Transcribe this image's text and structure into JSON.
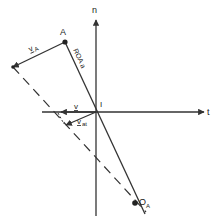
{
  "diagram": {
    "stroke_color": "#333333",
    "background": "#ffffff",
    "axes": {
      "n": {
        "label": "n"
      },
      "t": {
        "label": "t"
      }
    },
    "points": {
      "A": {
        "label": "A"
      },
      "I": {
        "label": "I"
      },
      "OA": {
        "label": "O",
        "subscript": "A"
      }
    },
    "labels": {
      "vA": {
        "text": "v",
        "subscript": "A"
      },
      "RoA": {
        "text": "ROA a"
      },
      "v": {
        "text": "v"
      },
      "vat": {
        "text": "v",
        "subscript": "at"
      }
    }
  }
}
